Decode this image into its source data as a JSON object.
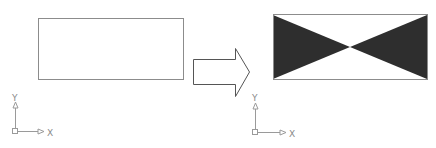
{
  "diagram": {
    "colors": {
      "outline": "#8c8c8c",
      "fill": "#2e2e2e",
      "arrow": "#555555",
      "ucs": "#9a9a9a"
    },
    "before": {
      "label": "",
      "ucs": {
        "x_label": "X",
        "y_label": "Y"
      }
    },
    "transition": {
      "icon": "right-arrow-icon"
    },
    "after": {
      "label": "",
      "ucs": {
        "x_label": "X",
        "y_label": "Y"
      }
    }
  }
}
